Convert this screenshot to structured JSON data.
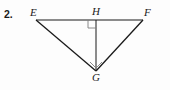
{
  "problem": {
    "number": "2."
  },
  "figure": {
    "name": "triangle-efg-with-altitude",
    "background_color": "#fdfdfd",
    "stroke_color": "#1a1a1a",
    "mark_color": "#7d7d7d",
    "vertices": [
      {
        "id": "E",
        "label": "E",
        "x": 36,
        "y": 20,
        "label_x": 30,
        "label_y": 7
      },
      {
        "id": "H",
        "label": "H",
        "x": 96,
        "y": 20,
        "label_x": 92,
        "label_y": 6
      },
      {
        "id": "F",
        "label": "F",
        "x": 143,
        "y": 20,
        "label_x": 144,
        "label_y": 7
      },
      {
        "id": "G",
        "label": "G",
        "x": 96,
        "y": 71,
        "label_x": 92,
        "label_y": 72
      }
    ],
    "segments": [
      {
        "name": "segment-EF",
        "from": "E",
        "to": "F"
      },
      {
        "name": "segment-EG",
        "from": "E",
        "to": "G"
      },
      {
        "name": "segment-FG",
        "from": "F",
        "to": "G"
      },
      {
        "name": "segment-HG",
        "from": "H",
        "to": "G"
      }
    ],
    "right_angle_marks": [
      {
        "name": "right-angle-mark-H",
        "at": "H",
        "size": 8
      },
      {
        "name": "right-angle-mark-G",
        "at": "G",
        "size": 8
      }
    ]
  },
  "chart_data": {
    "type": "diagram",
    "title": "",
    "shape": "triangle",
    "labels": [
      "E",
      "H",
      "F",
      "G"
    ],
    "points": {
      "E": [
        36,
        20
      ],
      "H": [
        96,
        20
      ],
      "F": [
        143,
        20
      ],
      "G": [
        96,
        71
      ]
    },
    "edges": [
      [
        "E",
        "F"
      ],
      [
        "E",
        "G"
      ],
      [
        "F",
        "G"
      ],
      [
        "H",
        "G"
      ]
    ],
    "annotations": [
      "right angle at H",
      "right angle at G"
    ]
  }
}
